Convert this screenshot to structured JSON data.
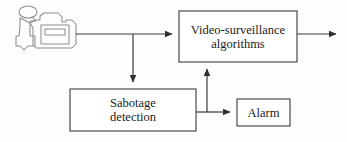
{
  "diagram": {
    "type": "block-diagram",
    "background_color": "#fdfdfd",
    "line_color": "#3a3a3a",
    "text_color": "#1b1b1b",
    "box_fill": "#ffffff",
    "nodes": [
      {
        "id": "camera",
        "kind": "icon",
        "icon": "video-camera-icon",
        "label": ""
      },
      {
        "id": "video_algorithms",
        "kind": "box",
        "label": "Video-surveillance\nalgorithms"
      },
      {
        "id": "sabotage_detection",
        "kind": "box",
        "label": "Sabotage\ndetection"
      },
      {
        "id": "alarm",
        "kind": "box",
        "label": "Alarm"
      }
    ],
    "edges": [
      {
        "id": "camera-to-video",
        "from": "camera",
        "to": "video_algorithms",
        "arrow": true
      },
      {
        "id": "camera-to-sabotage",
        "from": "camera",
        "to": "sabotage_detection",
        "arrow": true
      },
      {
        "id": "sabotage-to-video",
        "from": "sabotage_detection",
        "to": "video_algorithms",
        "arrow": true
      },
      {
        "id": "sabotage-to-alarm",
        "from": "sabotage_detection",
        "to": "alarm",
        "arrow": true
      },
      {
        "id": "video-output",
        "from": "video_algorithms",
        "to": "",
        "arrow": true
      }
    ]
  }
}
